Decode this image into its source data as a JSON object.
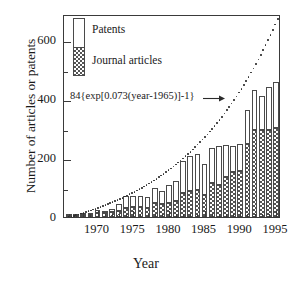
{
  "chart_data": {
    "type": "bar",
    "stacked": true,
    "title": "",
    "xlabel": "Year",
    "ylabel": "Number of articles or patents",
    "xlim": [
      1965.3,
      1995.7
    ],
    "ylim": [
      0,
      690
    ],
    "ytick_labels": [
      "0",
      "200",
      "400",
      "600"
    ],
    "yticks": [
      0,
      200,
      400,
      600
    ],
    "yticks_minor": [
      100,
      300,
      500
    ],
    "xtick_labels": [
      "1970",
      "1975",
      "1980",
      "1985",
      "1990",
      "1995"
    ],
    "xticks": [
      1970,
      1975,
      1980,
      1985,
      1990,
      1995
    ],
    "grid": false,
    "legend_position": "upper-left",
    "categories": [
      1966,
      1967,
      1968,
      1969,
      1970,
      1971,
      1972,
      1973,
      1974,
      1975,
      1976,
      1977,
      1978,
      1979,
      1980,
      1981,
      1982,
      1983,
      1984,
      1985,
      1986,
      1987,
      1988,
      1989,
      1990,
      1991,
      1992,
      1993,
      1994,
      1995
    ],
    "series": [
      {
        "name": "Journal articles",
        "values": [
          3,
          5,
          6,
          8,
          14,
          12,
          16,
          20,
          30,
          34,
          34,
          32,
          46,
          44,
          48,
          56,
          80,
          88,
          92,
          74,
          116,
          108,
          136,
          154,
          158,
          248,
          296,
          296,
          296,
          302
        ]
      },
      {
        "name": "Patents",
        "values": [
          2,
          3,
          4,
          6,
          11,
          8,
          12,
          24,
          40,
          36,
          38,
          36,
          54,
          44,
          60,
          68,
          112,
          120,
          122,
          106,
          120,
          134,
          110,
          88,
          90,
          116,
          136,
          116,
          146,
          156
        ]
      }
    ],
    "totals": [
      5,
      8,
      10,
      14,
      25,
      20,
      28,
      44,
      70,
      70,
      72,
      68,
      100,
      88,
      108,
      124,
      192,
      208,
      214,
      180,
      236,
      242,
      246,
      242,
      248,
      364,
      432,
      412,
      442,
      458
    ],
    "model_curve": {
      "label": "84{exp[0.073(year-1965)]-1}",
      "amplitude": 84,
      "rate": 0.073,
      "year_offset": 1965,
      "formula_text": "84{exp[0.073(year-1965)]-1}",
      "marker": "dotted"
    }
  },
  "legend": {
    "items": [
      {
        "label": "Patents",
        "swatch": "white-bar"
      },
      {
        "label": "Journal articles",
        "swatch": "checkered-bar"
      }
    ]
  },
  "annotation": {
    "text": "84{exp[0.073(year-1965)]-1}",
    "arrow": "arrow-right-icon"
  },
  "colors": {
    "axis": "#3a3a3a",
    "bar_outline": "#4a4a4a",
    "patents_fill": "#ffffff",
    "journal_fill": "#555555",
    "curve": "#2b2b2b",
    "background": "#ffffff"
  }
}
